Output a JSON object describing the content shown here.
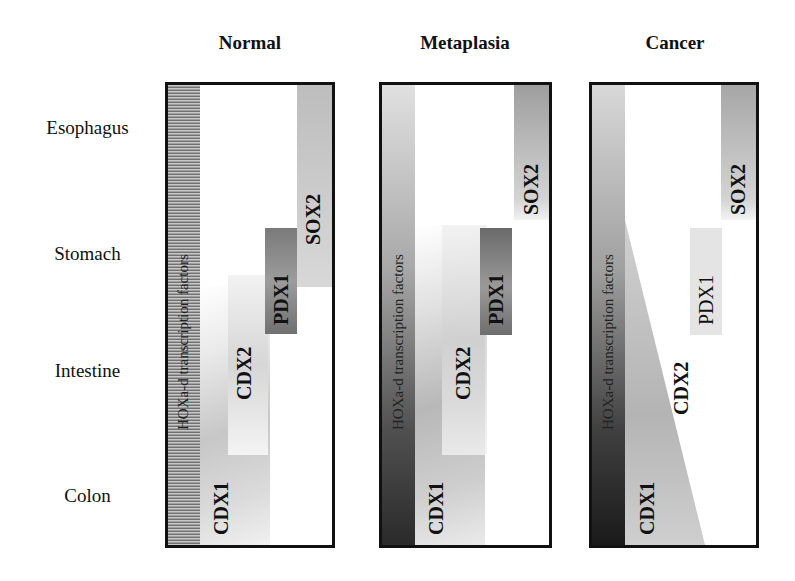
{
  "columns": [
    {
      "title": "Normal"
    },
    {
      "title": "Metaplasia"
    },
    {
      "title": "Cancer"
    }
  ],
  "rows": [
    {
      "label": "Esophagus"
    },
    {
      "label": "Stomach"
    },
    {
      "label": "Intestine"
    },
    {
      "label": "Colon"
    }
  ],
  "genes": {
    "hox": "HOXa-d transcription factors",
    "cdx1": "CDX1",
    "cdx2": "CDX2",
    "pdx1": "PDX1",
    "sox2": "SOX2"
  },
  "colors": {
    "border": "#111111",
    "dark_gray": "#4a4a4a",
    "mid_gray": "#9a9a9a",
    "light_gray": "#d8d8d8"
  }
}
